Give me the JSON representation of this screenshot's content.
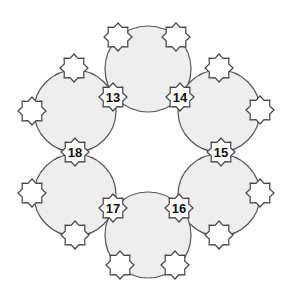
{
  "diagram": {
    "width": 292,
    "height": 297,
    "colors": {
      "background": "#ffffff",
      "circle_fill": "#eeeeee",
      "circle_stroke": "#555555",
      "star_fill": "#ffffff",
      "star_stroke": "#444444",
      "label_color": "#111111"
    },
    "star_shape": {
      "points": 8,
      "outer_radius": 14,
      "inner_radius": 10.5
    },
    "circles": [
      {
        "id": "top",
        "cx": 148,
        "cy": 69,
        "r": 43
      },
      {
        "id": "upper-right",
        "cx": 219,
        "cy": 111,
        "r": 41
      },
      {
        "id": "lower-right",
        "cx": 219,
        "cy": 195,
        "r": 41
      },
      {
        "id": "bottom",
        "cx": 148,
        "cy": 235,
        "r": 43
      },
      {
        "id": "lower-left",
        "cx": 75,
        "cy": 195,
        "r": 41
      },
      {
        "id": "upper-left",
        "cx": 75,
        "cy": 111,
        "r": 41
      }
    ],
    "blank_stars": [
      {
        "id": "top-circle-left",
        "cx": 118,
        "cy": 37
      },
      {
        "id": "top-circle-right",
        "cx": 176,
        "cy": 37
      },
      {
        "id": "upper-right-top",
        "cx": 219,
        "cy": 68
      },
      {
        "id": "upper-right-right",
        "cx": 260,
        "cy": 110
      },
      {
        "id": "lower-right-right",
        "cx": 260,
        "cy": 193
      },
      {
        "id": "lower-right-bottom",
        "cx": 219,
        "cy": 235
      },
      {
        "id": "bottom-circle-right",
        "cx": 175,
        "cy": 265
      },
      {
        "id": "bottom-circle-left",
        "cx": 120,
        "cy": 265
      },
      {
        "id": "lower-left-bottom",
        "cx": 75,
        "cy": 235
      },
      {
        "id": "lower-left-left",
        "cx": 32,
        "cy": 193
      },
      {
        "id": "upper-left-left",
        "cx": 32,
        "cy": 111
      },
      {
        "id": "upper-left-top",
        "cx": 74,
        "cy": 68
      }
    ],
    "numbered_stars": [
      {
        "label": "13",
        "cx": 113,
        "cy": 97
      },
      {
        "label": "14",
        "cx": 180,
        "cy": 97
      },
      {
        "label": "15",
        "cx": 221,
        "cy": 152
      },
      {
        "label": "16",
        "cx": 179,
        "cy": 208
      },
      {
        "label": "17",
        "cx": 113,
        "cy": 208
      },
      {
        "label": "18",
        "cx": 75,
        "cy": 152
      }
    ]
  }
}
